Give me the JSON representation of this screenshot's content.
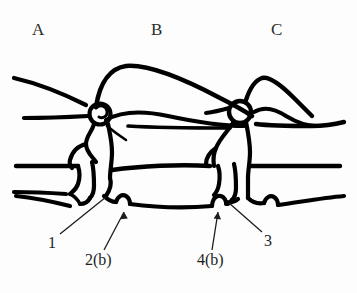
{
  "figure": {
    "background_color": "#fdfdfd",
    "ink_color": "#000000",
    "label_color": "#2b2b2b",
    "width": 357,
    "height": 293
  },
  "region_labels": [
    {
      "id": "A",
      "text": "A",
      "x": 32,
      "y": 21
    },
    {
      "id": "B",
      "text": "B",
      "x": 151,
      "y": 21
    },
    {
      "id": "C",
      "text": "C",
      "x": 271,
      "y": 21
    }
  ],
  "callouts": [
    {
      "id": "1",
      "text": "1",
      "x": 48,
      "y": 235,
      "pointer": "leader-line",
      "target": "left vertebral body inferior margin"
    },
    {
      "id": "2(b)",
      "text": "2(b)",
      "x": 85,
      "y": 252,
      "pointer": "arrow",
      "target": "left inferior notch / endplate step"
    },
    {
      "id": "4(b)",
      "text": "4(b)",
      "x": 197,
      "y": 252,
      "pointer": "arrow",
      "target": "right inferior notch / endplate step"
    },
    {
      "id": "3",
      "text": "3",
      "x": 264,
      "y": 233,
      "pointer": "leader-line",
      "target": "right vertebral body inferior margin"
    }
  ]
}
